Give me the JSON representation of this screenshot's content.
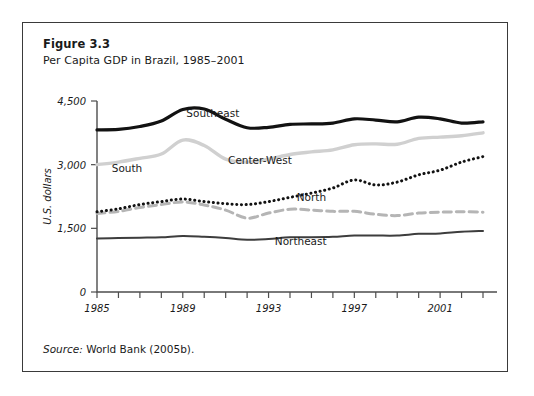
{
  "figure": {
    "number": "Figure 3.3",
    "title": "Per Capita GDP in Brazil, 1985–2001",
    "source_label": "Source:",
    "source_text": " World Bank (2005b)."
  },
  "chart_data": {
    "type": "line",
    "title": "Per Capita GDP in Brazil, 1985–2001",
    "xlabel": "",
    "ylabel": "U.S. dollars",
    "xlim": [
      1985,
      2003
    ],
    "ylim": [
      0,
      4500
    ],
    "yticks": [
      0,
      1500,
      3000,
      4500
    ],
    "ytick_labels": [
      "0",
      "1,500",
      "3,000",
      "4,500"
    ],
    "xticks": [
      1985,
      1986,
      1987,
      1988,
      1989,
      1990,
      1991,
      1992,
      1993,
      1994,
      1995,
      1996,
      1997,
      1998,
      1999,
      2000,
      2001,
      2002,
      2003
    ],
    "xtick_labels_shown": [
      "1985",
      "1989",
      "1993",
      "1997",
      "2001"
    ],
    "grid": false,
    "legend_position": "inline-labels",
    "x": [
      1985,
      1986,
      1987,
      1988,
      1989,
      1990,
      1991,
      1992,
      1993,
      1994,
      1995,
      1996,
      1997,
      1998,
      1999,
      2000,
      2001,
      2002,
      2003
    ],
    "series": [
      {
        "name": "Southeast",
        "style": "solid-thick-black",
        "color": "#121212",
        "label_x": 1990.4,
        "label_y": 4130,
        "values": [
          3820,
          3830,
          3900,
          4030,
          4300,
          4310,
          4070,
          3870,
          3880,
          3950,
          3960,
          3980,
          4080,
          4050,
          4010,
          4120,
          4080,
          3980,
          4010
        ]
      },
      {
        "name": "South",
        "style": "solid-thick-gray",
        "color": "#d0d0d0",
        "label_x": 1986.4,
        "label_y": 2830,
        "values": [
          3000,
          3060,
          3150,
          3250,
          3580,
          3450,
          3130,
          3060,
          3130,
          3240,
          3300,
          3350,
          3470,
          3490,
          3480,
          3620,
          3650,
          3680,
          3750
        ]
      },
      {
        "name": "Center-West",
        "style": "dotted-black",
        "color": "#121212",
        "label_x": 1992.6,
        "label_y": 3010,
        "values": [
          1890,
          1960,
          2060,
          2130,
          2190,
          2130,
          2080,
          2060,
          2130,
          2230,
          2330,
          2450,
          2640,
          2520,
          2590,
          2760,
          2870,
          3060,
          3190
        ]
      },
      {
        "name": "North",
        "style": "dashed-gray",
        "color": "#b5b5b5",
        "label_x": 1995.0,
        "label_y": 2140,
        "values": [
          1850,
          1900,
          1990,
          2060,
          2120,
          2050,
          1930,
          1740,
          1860,
          1950,
          1930,
          1900,
          1900,
          1830,
          1800,
          1860,
          1880,
          1890,
          1880
        ]
      },
      {
        "name": "Northeast",
        "style": "solid-thin-dark",
        "color": "#3d3d3d",
        "label_x": 1994.5,
        "label_y": 1100,
        "values": [
          1260,
          1270,
          1280,
          1290,
          1320,
          1300,
          1270,
          1230,
          1250,
          1290,
          1290,
          1300,
          1330,
          1330,
          1330,
          1370,
          1380,
          1420,
          1440
        ]
      }
    ]
  }
}
